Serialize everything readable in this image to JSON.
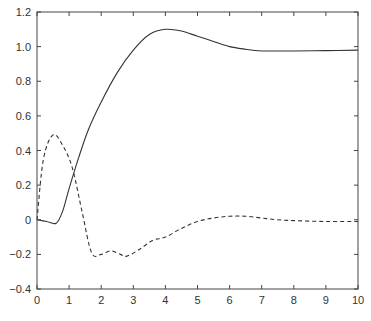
{
  "chart_data": {
    "type": "line",
    "title": "",
    "xlabel": "",
    "ylabel": "",
    "xlim": [
      0,
      10
    ],
    "ylim": [
      -0.4,
      1.2
    ],
    "grid": false,
    "legend": null,
    "x_ticks": [
      "0",
      "1",
      "2",
      "3",
      "4",
      "5",
      "6",
      "7",
      "8",
      "9",
      "10"
    ],
    "y_ticks": [
      "-0.4",
      "-0.2",
      "0",
      "0.2",
      "0.4",
      "0.6",
      "0.8",
      "1.0",
      "1.2"
    ],
    "series": [
      {
        "name": "solid",
        "style": "solid",
        "color": "#333333",
        "x": [
          0,
          0.3,
          0.6,
          0.8,
          1.0,
          1.3,
          1.6,
          2.0,
          2.5,
          3.0,
          3.5,
          4.0,
          4.5,
          5.0,
          5.5,
          6.0,
          6.5,
          7.0,
          7.5,
          8.0,
          9.0,
          10.0
        ],
        "y": [
          0,
          -0.01,
          -0.02,
          0.05,
          0.18,
          0.36,
          0.52,
          0.68,
          0.85,
          0.98,
          1.07,
          1.1,
          1.09,
          1.06,
          1.03,
          1.0,
          0.985,
          0.975,
          0.975,
          0.975,
          0.977,
          0.98
        ]
      },
      {
        "name": "dashed",
        "style": "dashed",
        "color": "#333333",
        "x": [
          0,
          0.2,
          0.5,
          0.8,
          1.1,
          1.4,
          1.7,
          2.0,
          2.3,
          2.6,
          2.8,
          3.2,
          3.6,
          4.0,
          4.5,
          5.0,
          5.5,
          6.0,
          6.5,
          7.0,
          7.5,
          8.0,
          9.0,
          10.0
        ],
        "y": [
          0,
          0.35,
          0.49,
          0.43,
          0.3,
          0.05,
          -0.19,
          -0.2,
          -0.18,
          -0.2,
          -0.21,
          -0.17,
          -0.12,
          -0.1,
          -0.05,
          -0.01,
          0.01,
          0.02,
          0.02,
          0.01,
          0.0,
          -0.005,
          -0.01,
          -0.01
        ]
      }
    ]
  }
}
